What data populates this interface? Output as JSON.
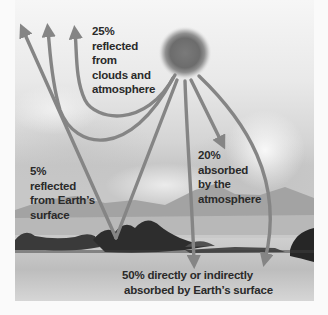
{
  "diagram": {
    "source_node": {
      "name": "Sun",
      "icon": "sun-icon"
    },
    "labels": {
      "reflected_clouds": {
        "percent": "25%",
        "lines": [
          "25%",
          "reflected",
          "from",
          "clouds and",
          "atmosphere"
        ]
      },
      "reflected_surface": {
        "percent": "5%",
        "lines": [
          "5%",
          "reflected",
          "from Earth’s",
          "surface"
        ]
      },
      "absorbed_atmosphere": {
        "percent": "20%",
        "lines": [
          "20%",
          "absorbed",
          "by the",
          "atmosphere"
        ]
      },
      "absorbed_surface": {
        "percent": "50%",
        "lines": [
          "50% directly or indirectly",
          "absorbed by Earth’s surface"
        ]
      }
    },
    "flows": [
      {
        "from": "Sun",
        "to": "space",
        "via": "clouds and atmosphere",
        "count": 3,
        "percent": 25
      },
      {
        "from": "Sun",
        "to": "Earth's surface",
        "then": "space",
        "percent": 5
      },
      {
        "from": "Sun",
        "to": "atmosphere",
        "percent": 20
      },
      {
        "from": "Sun",
        "to": "Earth's surface",
        "percent": 50,
        "count": 2
      }
    ],
    "colors": {
      "arrow": "#8a8a8a",
      "arrow_edge": "#6e6e6e",
      "sky_top": "#f2f2f2",
      "sky_cloud": "#d6d6d6",
      "mountain": "#9a9a9a",
      "water": "#c8c8c8",
      "land": "#2e2e2e",
      "text": "#2a2a2a"
    }
  }
}
